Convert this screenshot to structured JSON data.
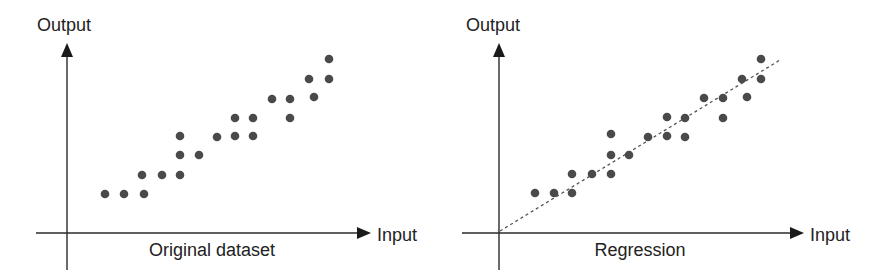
{
  "colors": {
    "background": "#ffffff",
    "axis": "#2a2a2a",
    "point": "#4a4a4a",
    "text": "#222222",
    "regression_line": "#555555"
  },
  "panels": [
    {
      "id": "original",
      "y_axis_label": "Output",
      "x_axis_label": "Input",
      "caption": "Original dataset",
      "has_regression_line": false
    },
    {
      "id": "regression",
      "y_axis_label": "Output",
      "x_axis_label": "Input",
      "caption": "Regression",
      "has_regression_line": true
    }
  ],
  "chart_data": [
    {
      "type": "scatter",
      "title": "Original dataset",
      "xlabel": "Input",
      "ylabel": "Output",
      "grid": false,
      "note": "No numeric ticks; coordinates are pixel positions relative to axis origin (x right, y up)",
      "points": [
        [
          38,
          39
        ],
        [
          57,
          39
        ],
        [
          77,
          39
        ],
        [
          75,
          58
        ],
        [
          95,
          58
        ],
        [
          113,
          58
        ],
        [
          113,
          78
        ],
        [
          132,
          78
        ],
        [
          113,
          97
        ],
        [
          150,
          96
        ],
        [
          168,
          97
        ],
        [
          186,
          97
        ],
        [
          168,
          115
        ],
        [
          186,
          115
        ],
        [
          205,
          134
        ],
        [
          223,
          134
        ],
        [
          223,
          115
        ],
        [
          242,
          154
        ],
        [
          247,
          136
        ],
        [
          262,
          154
        ],
        [
          262,
          174
        ]
      ]
    },
    {
      "type": "scatter",
      "title": "Regression",
      "xlabel": "Input",
      "ylabel": "Output",
      "grid": false,
      "note": "Same dataset with dashed linear regression line from origin",
      "points": [
        [
          36,
          40
        ],
        [
          55,
          40
        ],
        [
          73,
          40
        ],
        [
          73,
          59
        ],
        [
          93,
          59
        ],
        [
          112,
          59
        ],
        [
          112,
          78
        ],
        [
          130,
          78
        ],
        [
          112,
          99
        ],
        [
          149,
          96
        ],
        [
          168,
          97
        ],
        [
          186,
          96
        ],
        [
          168,
          116
        ],
        [
          186,
          115
        ],
        [
          205,
          135
        ],
        [
          224,
          135
        ],
        [
          224,
          115
        ],
        [
          243,
          154
        ],
        [
          248,
          136
        ],
        [
          262,
          154
        ],
        [
          262,
          174
        ]
      ],
      "regression_line": {
        "from": [
          1,
          2
        ],
        "to": [
          281,
          173
        ],
        "style": "dashed"
      }
    }
  ]
}
